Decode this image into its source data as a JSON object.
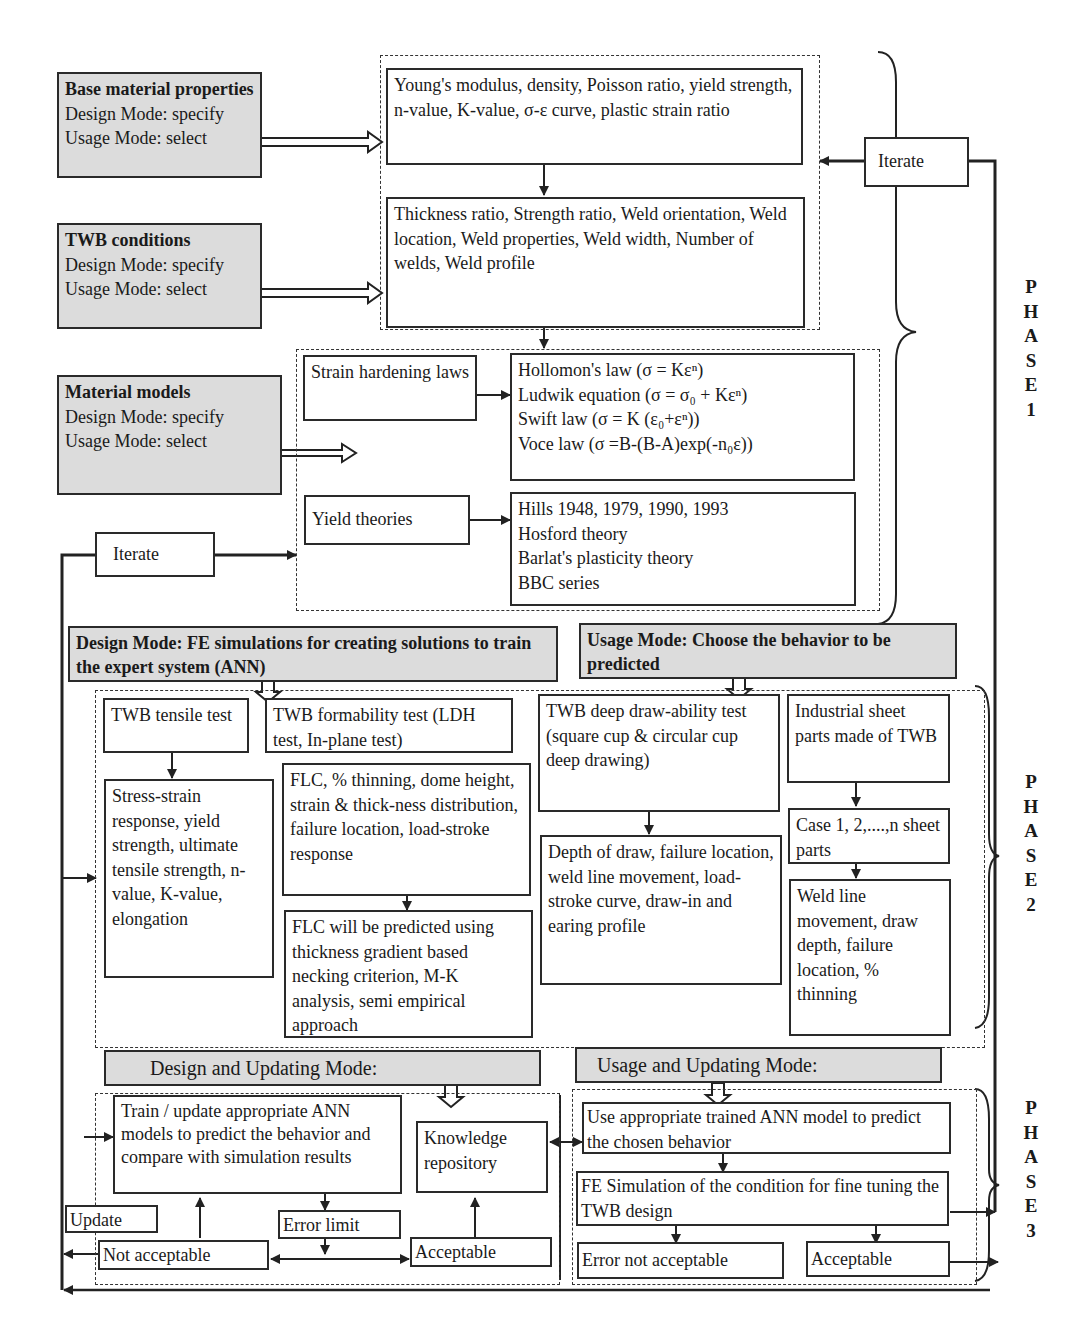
{
  "inputs": {
    "base_material": {
      "title": "Base material properties",
      "design": "Design Mode: specify",
      "usage": "Usage Mode: select"
    },
    "twb_conditions": {
      "title": "TWB conditions",
      "design": "Design Mode: specify",
      "usage": "Usage Mode: select"
    },
    "material_models": {
      "title": "Material models",
      "design": "Design Mode:  specify",
      "usage": "Usage Mode: select"
    }
  },
  "phase1": {
    "properties_box": "Young's modulus, density, Poisson ratio, yield strength, n-value, K-value, σ-ε curve, plastic strain ratio",
    "twb_params_box": "Thickness ratio, Strength ratio, Weld orientation, Weld location, Weld properties, Weld width, Number of welds, Weld profile",
    "strain_hardening": "Strain hardening laws",
    "hardening_laws": [
      "Hollomon's law (σ = Kεⁿ)",
      "Ludwik equation (σ = σ₀ + Kεⁿ)",
      "Swift law (σ = K (ε₀+εⁿ))",
      "Voce law (σ =B-(B-A)exp(-n₀ε))"
    ],
    "yield_theories": "Yield theories",
    "yield_list": [
      "Hills 1948, 1979, 1990, 1993",
      "Hosford theory",
      "Barlat's plasticity theory",
      "BBC series"
    ],
    "iterate_right": "Iterate",
    "iterate_left": "Iterate"
  },
  "phase2": {
    "design_header": "Design Mode: FE simulations for creating solutions to train the expert system (ANN)",
    "usage_header": "Usage Mode: Choose the behavior to be predicted",
    "tensile_test": "TWB tensile test",
    "tensile_results": "Stress-strain response, yield strength, ultimate tensile strength, n-value, K-value, elongation",
    "formability_test": "TWB formability test (LDH test, In-plane test)",
    "formability_results": "FLC, % thinning, dome height, strain & thick-ness distribution, failure location, load-stroke response",
    "flc_prediction": "FLC will be predicted using thickness gradient based necking criterion, M-K analysis, semi empirical approach",
    "deep_draw_test": "TWB deep draw-ability test (square cup & circular cup deep drawing)",
    "deep_draw_results": "Depth of draw, failure location, weld line movement, load-stroke curve, draw-in and earing profile",
    "industrial_parts": "Industrial sheet parts made of TWB",
    "cases": "Case 1, 2,....,n sheet parts",
    "industrial_results": "Weld line movement, draw depth, failure location, % thinning"
  },
  "phase3": {
    "design_update_header": "Design and Updating Mode:",
    "usage_update_header": "Usage and Updating Mode:",
    "train_box": "Train / update appropriate ANN models to predict the behavior and compare with simulation results",
    "knowledge_repo": "Knowledge repository",
    "update": "Update",
    "error_limit": "Error limit",
    "not_acceptable": "Not acceptable",
    "acceptable_left": "Acceptable",
    "use_ann": "Use appropriate trained ANN model to predict the chosen behavior",
    "fe_simulation": "FE Simulation of the condition for fine tuning the TWB design",
    "error_not_acceptable": "Error not acceptable",
    "acceptable_right": "Acceptable"
  },
  "phase_labels": {
    "p1": [
      "P",
      "H",
      "A",
      "S",
      "E",
      "1"
    ],
    "p2": [
      "P",
      "H",
      "A",
      "S",
      "E",
      "2"
    ],
    "p3": [
      "P",
      "H",
      "A",
      "S",
      "E",
      "3"
    ]
  }
}
